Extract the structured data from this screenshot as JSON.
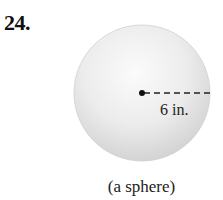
{
  "problem": {
    "number": "24."
  },
  "figure": {
    "shape": "sphere",
    "radius_label": "6 in.",
    "caption": "(a sphere)",
    "colors": {
      "fill_light": "#f7f7f7",
      "fill_dark": "#d6d6d6",
      "line": "#222222"
    }
  }
}
